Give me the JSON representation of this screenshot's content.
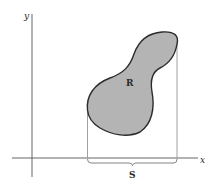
{
  "diagram": {
    "type": "region-projection",
    "axes": {
      "x_label": "x",
      "y_label": "y"
    },
    "region": {
      "label": "R",
      "fill_color": "#b4b4b4",
      "stroke_color": "#2b2b2b"
    },
    "projection": {
      "label": "S"
    },
    "colors": {
      "axis": "#555555",
      "guide": "#888888",
      "background": "#ffffff"
    }
  }
}
